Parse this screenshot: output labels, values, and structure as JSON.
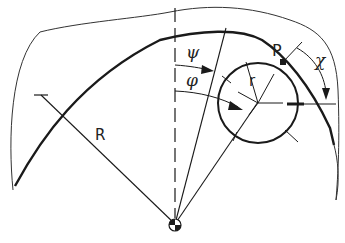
{
  "diagram": {
    "type": "geometric construction",
    "labels": {
      "big_radius": "R",
      "small_radius": "r",
      "point": "P",
      "angle_psi": "ψ",
      "angle_phi": "φ",
      "angle_chi": "χ"
    },
    "colors": {
      "stroke": "#1a1a1a",
      "background": "#ffffff"
    }
  }
}
